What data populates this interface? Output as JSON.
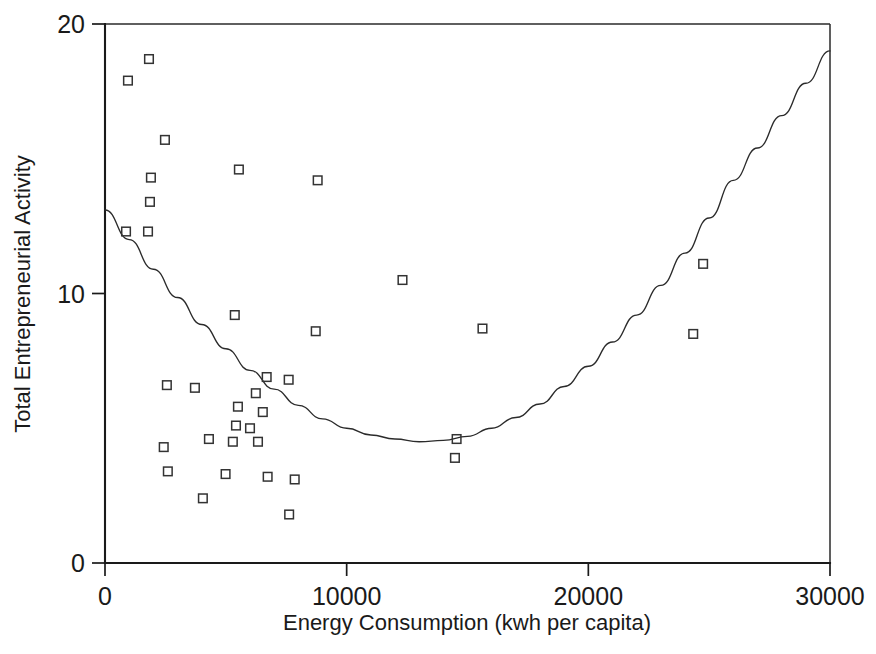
{
  "chart_data": {
    "type": "scatter",
    "title": "",
    "xlabel": "Energy Consumption (kwh per capita)",
    "ylabel": "Total Entrepreneurial Activity",
    "xlim": [
      0,
      30000
    ],
    "ylim": [
      0,
      20
    ],
    "xticks": [
      0,
      10000,
      20000,
      30000
    ],
    "xticklabels": [
      "0",
      "10000",
      "20000",
      "30000"
    ],
    "yticks": [
      0,
      10,
      20
    ],
    "yticklabels": [
      "0",
      "10",
      "20"
    ],
    "grid": false,
    "legend": null,
    "marker_style": "open-square",
    "series": [
      {
        "name": "Countries",
        "type": "scatter",
        "points": [
          [
            950,
            17.9
          ],
          [
            1820,
            18.7
          ],
          [
            2480,
            15.7
          ],
          [
            1900,
            14.3
          ],
          [
            5540,
            14.6
          ],
          [
            8800,
            14.2
          ],
          [
            1860,
            13.4
          ],
          [
            870,
            12.3
          ],
          [
            1780,
            12.3
          ],
          [
            12310,
            10.5
          ],
          [
            24750,
            11.1
          ],
          [
            5370,
            9.2
          ],
          [
            8720,
            8.6
          ],
          [
            15620,
            8.7
          ],
          [
            24340,
            8.5
          ],
          [
            2560,
            6.6
          ],
          [
            3720,
            6.5
          ],
          [
            6690,
            6.9
          ],
          [
            7600,
            6.8
          ],
          [
            6240,
            6.3
          ],
          [
            5500,
            5.8
          ],
          [
            6530,
            5.6
          ],
          [
            5420,
            5.1
          ],
          [
            6000,
            5.0
          ],
          [
            4300,
            4.6
          ],
          [
            5290,
            4.5
          ],
          [
            6330,
            4.5
          ],
          [
            2430,
            4.3
          ],
          [
            14550,
            4.6
          ],
          [
            14480,
            3.9
          ],
          [
            2600,
            3.4
          ],
          [
            4990,
            3.3
          ],
          [
            6730,
            3.2
          ],
          [
            7850,
            3.1
          ],
          [
            4050,
            2.4
          ],
          [
            7620,
            1.8
          ]
        ]
      },
      {
        "name": "Fitted quadratic curve",
        "type": "line",
        "points": [
          [
            0,
            13.1
          ],
          [
            1000,
            12.0
          ],
          [
            2000,
            10.9
          ],
          [
            3000,
            9.85
          ],
          [
            4000,
            8.85
          ],
          [
            5000,
            7.95
          ],
          [
            6000,
            7.15
          ],
          [
            7000,
            6.45
          ],
          [
            8000,
            5.85
          ],
          [
            9000,
            5.35
          ],
          [
            10000,
            5.0
          ],
          [
            11000,
            4.75
          ],
          [
            12000,
            4.6
          ],
          [
            13000,
            4.5
          ],
          [
            14000,
            4.55
          ],
          [
            15000,
            4.7
          ],
          [
            16000,
            5.0
          ],
          [
            17000,
            5.4
          ],
          [
            18000,
            5.9
          ],
          [
            19000,
            6.55
          ],
          [
            20000,
            7.3
          ],
          [
            21000,
            8.2
          ],
          [
            22000,
            9.2
          ],
          [
            23000,
            10.3
          ],
          [
            24000,
            11.5
          ],
          [
            25000,
            12.8
          ],
          [
            26000,
            14.2
          ],
          [
            27000,
            15.4
          ],
          [
            28000,
            16.6
          ],
          [
            29000,
            17.8
          ],
          [
            30000,
            19.0
          ]
        ]
      }
    ]
  },
  "colors": {
    "axis": "#1a1a1a",
    "marker": "#333333",
    "curve": "#2b2b2b",
    "background": "#ffffff"
  }
}
